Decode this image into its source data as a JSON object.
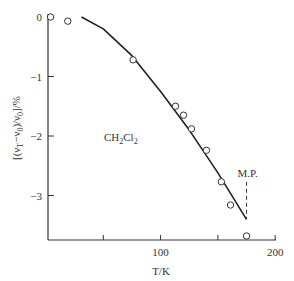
{
  "chart_data": {
    "type": "scatter",
    "title": "",
    "annotation": "CH2Cl2",
    "annotation_text": {
      "main": "CH",
      "sub1": "2",
      "mid": "Cl",
      "sub2": "2"
    },
    "xlabel": "T/K",
    "ylabel": "[(νT−ν0)/ν0]/%",
    "ylabel_parts": {
      "open": "[(ν",
      "subT": "T",
      "minus": "−ν",
      "sub0a": "0",
      "div": ")/ν",
      "sub0b": "0",
      "close": "]/%"
    },
    "xlim": [
      0,
      200
    ],
    "ylim": [
      -3.8,
      0
    ],
    "x_ticks": [
      50,
      100,
      150,
      200
    ],
    "x_tick_labels": [
      "",
      "100",
      "",
      "200"
    ],
    "y_ticks": [
      0,
      -1,
      -2,
      -3
    ],
    "y_tick_labels": [
      "0",
      "−1",
      "−2",
      "−3"
    ],
    "grid": false,
    "series": [
      {
        "name": "measured",
        "style": "open-circle",
        "x": [
          4,
          19,
          76,
          113,
          120,
          127,
          140,
          153,
          161,
          175
        ],
        "y": [
          0.0,
          -0.07,
          -0.72,
          -1.5,
          -1.65,
          -1.88,
          -2.24,
          -2.77,
          -3.16,
          -3.68
        ]
      },
      {
        "name": "fit",
        "style": "solid-line",
        "x": [
          31,
          50,
          75,
          100,
          125,
          150,
          175
        ],
        "y": [
          0.0,
          -0.2,
          -0.65,
          -1.25,
          -1.9,
          -2.62,
          -3.4
        ]
      }
    ],
    "reference_lines": [
      {
        "label": "M.P.",
        "x": 175,
        "y_from": -2.77,
        "y_to": -3.4,
        "style": "dashed"
      }
    ]
  }
}
